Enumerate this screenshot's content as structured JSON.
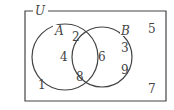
{
  "diagram": {
    "type": "venn",
    "universe_label": "U",
    "sets": [
      {
        "name": "A",
        "only": [
          "2",
          "4",
          "8"
        ]
      },
      {
        "name": "B",
        "only": [
          "3",
          "9"
        ]
      }
    ],
    "intersection": [
      "6"
    ],
    "outside": [
      "1",
      "5",
      "7"
    ],
    "labels": {
      "U": "U",
      "A": "A",
      "B": "B",
      "n2": "2",
      "n4": "4",
      "n8": "8",
      "n6": "6",
      "n3": "3",
      "n9": "9",
      "n1": "1",
      "n5": "5",
      "n7": "7"
    },
    "stroke_color": "#444444"
  }
}
